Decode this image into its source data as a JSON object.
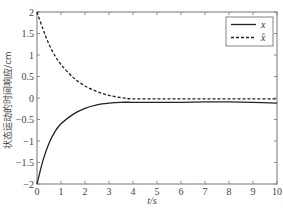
{
  "chart_data": {
    "type": "line",
    "title": "",
    "xlabel": "t/s",
    "ylabel": "状态运动的时间响应/cm",
    "xlim": [
      0,
      10
    ],
    "ylim": [
      -2,
      2
    ],
    "xticks": [
      0,
      1,
      2,
      3,
      4,
      5,
      6,
      7,
      8,
      9,
      10
    ],
    "yticks": [
      -2,
      -1.5,
      -1,
      -0.5,
      0,
      0.5,
      1,
      1.5,
      2
    ],
    "xtick_labels": [
      "0",
      "1",
      "2",
      "3",
      "4",
      "5",
      "6",
      "7",
      "8",
      "9",
      "10"
    ],
    "ytick_labels": [
      "-2",
      "-1.5",
      "-1",
      "-0.5",
      "0",
      "0.5",
      "1",
      "1.5",
      "2"
    ],
    "grid": false,
    "legend_position": "upper right",
    "series": [
      {
        "name": "x",
        "style": "solid",
        "color": "#222222",
        "x": [
          0,
          0.25,
          0.5,
          0.75,
          1,
          1.5,
          2,
          2.5,
          3,
          3.5,
          4,
          5,
          6,
          7,
          8,
          9,
          10
        ],
        "values": [
          -2,
          -1.45,
          -1.05,
          -0.78,
          -0.6,
          -0.38,
          -0.24,
          -0.16,
          -0.12,
          -0.1,
          -0.1,
          -0.1,
          -0.1,
          -0.09,
          -0.09,
          -0.1,
          -0.12
        ]
      },
      {
        "name": "x̂",
        "style": "dashed",
        "color": "#222222",
        "x": [
          0,
          0.25,
          0.5,
          0.75,
          1,
          1.5,
          2,
          2.5,
          3,
          3.5,
          4,
          5,
          6,
          7,
          8,
          9,
          10
        ],
        "values": [
          2,
          1.6,
          1.25,
          0.98,
          0.78,
          0.48,
          0.28,
          0.15,
          0.06,
          0.01,
          -0.02,
          -0.02,
          -0.02,
          -0.02,
          -0.02,
          -0.02,
          -0.02
        ]
      }
    ]
  },
  "legend": {
    "items": [
      {
        "label": "x",
        "style": "solid"
      },
      {
        "label": "x̂",
        "style": "dashed"
      }
    ]
  },
  "axes": {
    "xlabel": "t/s",
    "ylabel": "状态运动的时间响应/cm"
  }
}
